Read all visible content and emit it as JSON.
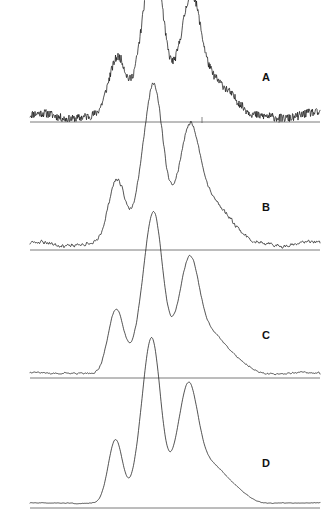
{
  "figure": {
    "type": "multi-panel-spectra",
    "background_color": "#ffffff",
    "trace_color": "#1a1a1a",
    "baseline_color": "#6b6b6b",
    "width": 335,
    "height": 523
  },
  "chart_data": {
    "type": "line",
    "title": "",
    "xlabel": "",
    "ylabel": "",
    "grid": false,
    "legend_position": "inline-right",
    "x_range": [
      30,
      320
    ],
    "panels": [
      {
        "label": "A",
        "label_x": 262,
        "label_y": 72,
        "baseline_y": 122,
        "panel_top": 8,
        "plot_height": 114,
        "noise_amplitude": 4.2,
        "noise_seed": 11,
        "smoothing": 0,
        "baseline_x0": 30,
        "baseline_x1": 320,
        "ticks": [
          {
            "x": 202,
            "depth": 5
          },
          {
            "x": 279,
            "depth": 5
          }
        ],
        "peaks": [
          {
            "center": 113,
            "height": 38,
            "width": 7.5
          },
          {
            "center": 121,
            "height": 30,
            "width": 6.0
          },
          {
            "center": 149,
            "height": 92,
            "width": 11.0
          },
          {
            "center": 156,
            "height": 80,
            "width": 8.0
          },
          {
            "center": 186,
            "height": 66,
            "width": 12.0
          },
          {
            "center": 193,
            "height": 58,
            "width": 8.0
          },
          {
            "center": 207,
            "height": 22,
            "width": 10.0
          },
          {
            "center": 221,
            "height": 16,
            "width": 12.0
          },
          {
            "center": 236,
            "height": 8,
            "width": 12.0
          }
        ],
        "baseline_offset": 6
      },
      {
        "label": "B",
        "label_x": 262,
        "label_y": 202,
        "baseline_y": 250,
        "panel_top": 138,
        "plot_height": 112,
        "noise_amplitude": 2.8,
        "noise_seed": 23,
        "smoothing": 1,
        "baseline_x0": 30,
        "baseline_x1": 320,
        "ticks": [],
        "peaks": [
          {
            "center": 113,
            "height": 40,
            "width": 7.5
          },
          {
            "center": 120,
            "height": 31,
            "width": 6.5
          },
          {
            "center": 149,
            "height": 92,
            "width": 11.0
          },
          {
            "center": 156,
            "height": 78,
            "width": 8.0
          },
          {
            "center": 185,
            "height": 64,
            "width": 12.0
          },
          {
            "center": 192,
            "height": 58,
            "width": 8.5
          },
          {
            "center": 207,
            "height": 26,
            "width": 10.0
          },
          {
            "center": 221,
            "height": 20,
            "width": 12.0
          },
          {
            "center": 236,
            "height": 9,
            "width": 12.0
          }
        ],
        "baseline_offset": 6
      },
      {
        "label": "C",
        "label_x": 262,
        "label_y": 330,
        "baseline_y": 378,
        "panel_top": 268,
        "plot_height": 110,
        "noise_amplitude": 1.3,
        "noise_seed": 37,
        "smoothing": 2,
        "baseline_x0": 30,
        "baseline_x1": 320,
        "ticks": [],
        "peaks": [
          {
            "center": 113,
            "height": 41,
            "width": 7.0
          },
          {
            "center": 120,
            "height": 30,
            "width": 6.5
          },
          {
            "center": 149,
            "height": 92,
            "width": 10.5
          },
          {
            "center": 156,
            "height": 80,
            "width": 8.0
          },
          {
            "center": 184,
            "height": 62,
            "width": 11.0
          },
          {
            "center": 192,
            "height": 60,
            "width": 8.5
          },
          {
            "center": 207,
            "height": 24,
            "width": 10.0
          },
          {
            "center": 220,
            "height": 19,
            "width": 11.0
          },
          {
            "center": 236,
            "height": 10,
            "width": 12.0
          }
        ],
        "baseline_offset": 5
      },
      {
        "label": "D",
        "label_x": 262,
        "label_y": 458,
        "baseline_y": 508,
        "panel_top": 398,
        "plot_height": 110,
        "noise_amplitude": 0.6,
        "noise_seed": 51,
        "smoothing": 3,
        "baseline_x0": 30,
        "baseline_x1": 320,
        "ticks": [],
        "peaks": [
          {
            "center": 113,
            "height": 42,
            "width": 6.5
          },
          {
            "center": 119,
            "height": 28,
            "width": 6.0
          },
          {
            "center": 148,
            "height": 94,
            "width": 10.0
          },
          {
            "center": 154,
            "height": 80,
            "width": 8.0
          },
          {
            "center": 183,
            "height": 64,
            "width": 10.5
          },
          {
            "center": 191,
            "height": 62,
            "width": 8.5
          },
          {
            "center": 206,
            "height": 24,
            "width": 10.0
          },
          {
            "center": 219,
            "height": 20,
            "width": 11.0
          },
          {
            "center": 236,
            "height": 11,
            "width": 12.0
          }
        ],
        "baseline_offset": 5
      }
    ]
  }
}
